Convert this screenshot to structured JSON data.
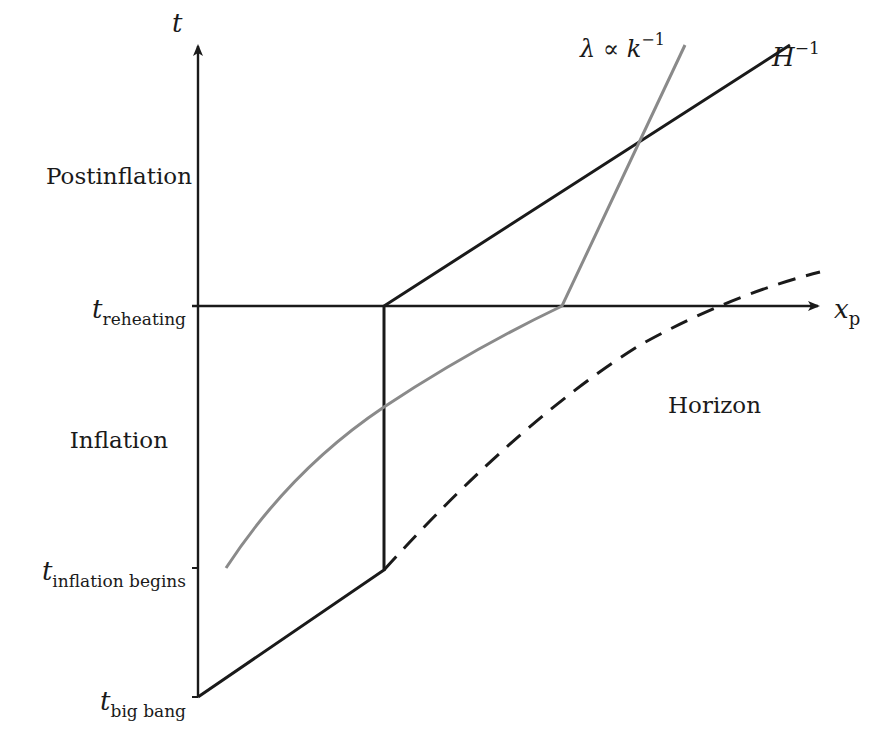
{
  "diagram": {
    "axes": {
      "y_axis_label": "t",
      "x_axis_label": "x",
      "x_axis_label_sub": "p"
    },
    "ticks": [
      {
        "main": "t",
        "sub": "reheating"
      },
      {
        "main": "t",
        "sub": "inflation begins"
      },
      {
        "main": "t",
        "sub": "big bang"
      }
    ],
    "regions": {
      "postinflation": "Postinflation",
      "inflation": "Inflation"
    },
    "curves": {
      "hubble_label": "H",
      "hubble_sup": "−1",
      "wavelength_label": "λ ∝ k",
      "wavelength_sup": "−1",
      "horizon_label": "Horizon"
    },
    "colors": {
      "axis": "#1a1a1a",
      "hubble_radius": "#1a1a1a",
      "wavelength": "#8a8a8a",
      "horizon": "#1a1a1a"
    }
  }
}
